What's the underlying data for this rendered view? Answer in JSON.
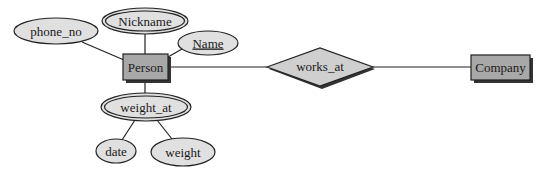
{
  "diagram": {
    "type": "ER diagram",
    "entities": [
      {
        "id": "person",
        "label": "Person"
      },
      {
        "id": "company",
        "label": "Company"
      }
    ],
    "relationships": [
      {
        "id": "works_at",
        "label": "works_at",
        "connects": [
          "person",
          "company"
        ]
      }
    ],
    "attributes": [
      {
        "id": "nickname",
        "label": "Nickname",
        "kind": "multivalued",
        "of": "person"
      },
      {
        "id": "phone_no",
        "label": "phone_no",
        "kind": "simple",
        "of": "person"
      },
      {
        "id": "name",
        "label": "Name",
        "kind": "key",
        "of": "person"
      },
      {
        "id": "weight_at",
        "label": "weight_at",
        "kind": "multivalued composite",
        "of": "person"
      },
      {
        "id": "date",
        "label": "date",
        "kind": "simple",
        "of": "weight_at"
      },
      {
        "id": "weight",
        "label": "weight",
        "kind": "simple",
        "of": "weight_at"
      }
    ],
    "colors": {
      "attribute_fill": "#e0e0e0",
      "entity_fill": "#a8a8a8",
      "relationship_fill": "#cfcfcf",
      "stroke": "#222222",
      "shadow": "#333333"
    }
  }
}
